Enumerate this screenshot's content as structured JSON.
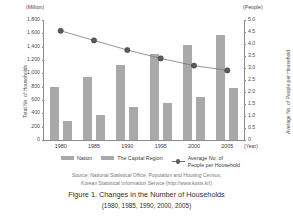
{
  "chart_data": {
    "type": "bar",
    "title": "Figure 1.  Changes in the Number of Households",
    "subtitle": "(1980, 1985, 1990, 2000, 2005)",
    "categories": [
      "1980",
      "1985",
      "1990",
      "1995",
      "2000",
      "2005"
    ],
    "xlabel": "(Year)",
    "ylabel": "Total No. of Households",
    "ylabel_unit": "(Million)",
    "ylim": [
      0,
      1800
    ],
    "yticks": [
      "1,800",
      "1,600",
      "1,400",
      "1,200",
      "1,000",
      "800",
      "600",
      "400",
      "200",
      "0"
    ],
    "y2label": "Average No. of People per Household",
    "y2label_unit": "(People)",
    "y2lim": [
      0,
      5.0
    ],
    "y2ticks": [
      "5.0",
      "4.5",
      "4.0",
      "3.5",
      "3.0",
      "2.5",
      "2.0",
      "1.5",
      "1.0",
      "0.5",
      "0"
    ],
    "grid": false,
    "legend_position": "bottom",
    "series": [
      {
        "name": "Nation",
        "type": "bar",
        "axis": "left",
        "color": "#a9a9a9",
        "values": [
          790,
          950,
          1130,
          1290,
          1420,
          1580
        ]
      },
      {
        "name": "The Capital Region",
        "type": "bar",
        "axis": "left",
        "color": "#a9a9a9",
        "values": [
          280,
          375,
          490,
          560,
          650,
          780
        ]
      },
      {
        "name": "Average No. of People per Household",
        "type": "line",
        "axis": "right",
        "color": "#5a5a5a",
        "values": [
          4.55,
          4.15,
          3.75,
          3.4,
          3.1,
          2.9
        ]
      }
    ],
    "source": {
      "line1": "Source: National Statistical Office, Population and Housing Census,",
      "line2": "Korean Statistical Information Service (http://www.kosis.kr/)"
    }
  },
  "legend": {
    "nation": "Nation",
    "capital": "The Capital Region",
    "average_line1": "Average No. of",
    "average_line2": "People per Household"
  }
}
